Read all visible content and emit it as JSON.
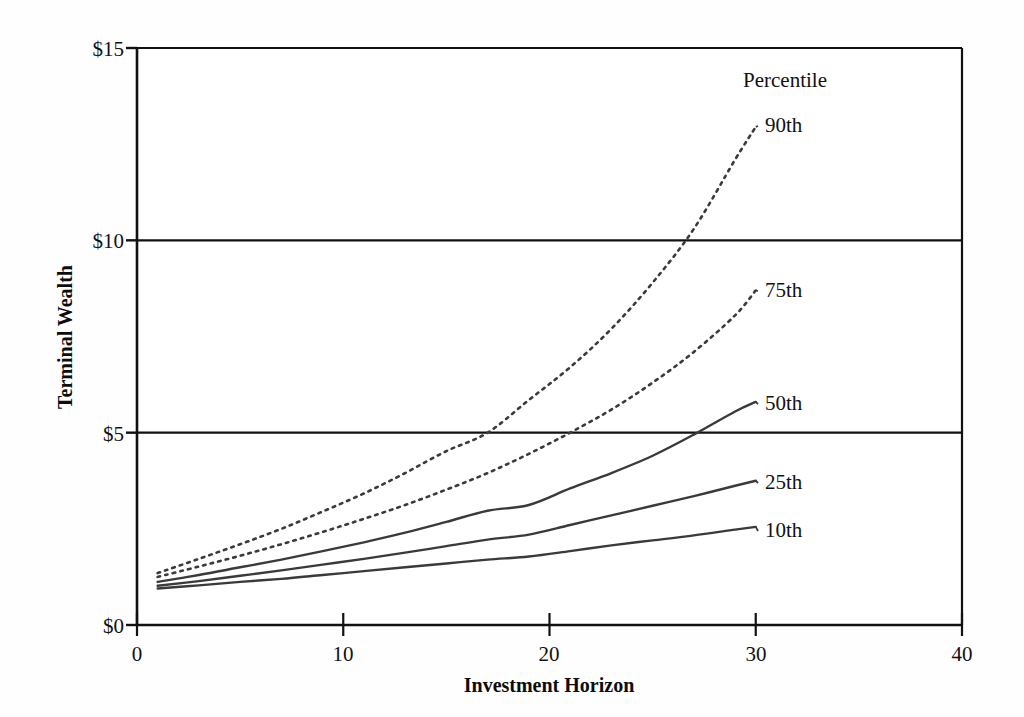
{
  "chart_data": {
    "type": "line",
    "title": "",
    "xlabel": "Investment Horizon",
    "ylabel": "Terminal Wealth",
    "xlim": [
      0,
      40
    ],
    "ylim": [
      0,
      15
    ],
    "xticks": [
      0,
      10,
      20,
      30,
      40
    ],
    "xtick_labels": [
      "0",
      "10",
      "20",
      "30",
      "40"
    ],
    "yticks": [
      0,
      5,
      10,
      15
    ],
    "ytick_labels": [
      "$0",
      "$5",
      "$10",
      "$15"
    ],
    "grid": "horizontal gridlines at $5 and $10 only",
    "legend_position": "inline labels at right end of each curve",
    "legend_title": "Percentile",
    "x": [
      1,
      3,
      5,
      7,
      9,
      11,
      13,
      15,
      17,
      19,
      21,
      23,
      25,
      27,
      29,
      30
    ],
    "series": [
      {
        "name": "90th",
        "label": "90th",
        "style": "dotted",
        "values": [
          1.35,
          1.72,
          2.1,
          2.5,
          2.95,
          3.42,
          3.95,
          4.52,
          5.0,
          5.85,
          6.7,
          7.7,
          8.9,
          10.3,
          12.1,
          12.95
        ],
        "end_value": 12.95
      },
      {
        "name": "75th",
        "label": "75th",
        "style": "dotted",
        "values": [
          1.25,
          1.52,
          1.8,
          2.1,
          2.42,
          2.76,
          3.12,
          3.52,
          3.95,
          4.45,
          5.0,
          5.6,
          6.3,
          7.1,
          8.05,
          8.7
        ],
        "end_value": 8.7
      },
      {
        "name": "50th",
        "label": "50th",
        "style": "solid",
        "values": [
          1.12,
          1.3,
          1.5,
          1.7,
          1.92,
          2.15,
          2.4,
          2.68,
          2.97,
          3.12,
          3.55,
          3.95,
          4.4,
          4.95,
          5.55,
          5.8
        ],
        "end_value": 5.8
      },
      {
        "name": "25th",
        "label": "25th",
        "style": "solid",
        "values": [
          1.02,
          1.14,
          1.28,
          1.42,
          1.57,
          1.72,
          1.88,
          2.05,
          2.22,
          2.35,
          2.6,
          2.85,
          3.1,
          3.35,
          3.62,
          3.75
        ],
        "end_value": 3.75
      },
      {
        "name": "10th",
        "label": "10th",
        "style": "solid",
        "values": [
          0.95,
          1.03,
          1.12,
          1.2,
          1.3,
          1.4,
          1.5,
          1.6,
          1.7,
          1.78,
          1.92,
          2.07,
          2.2,
          2.33,
          2.48,
          2.55
        ],
        "end_value": 2.55
      }
    ],
    "annotations": [
      "90th percentile crosses $5 near horizon 17 and $10 near horizon 26",
      "75th percentile crosses $5 near horizon 21",
      "50th percentile crosses $5 near horizon 27"
    ],
    "colors": {
      "axis": "#111111",
      "gridline": "#111111",
      "series_line": "#3a3a3a",
      "background": "#fefefe"
    }
  },
  "legend": {
    "title": "Percentile",
    "entries": [
      "90th",
      "75th",
      "50th",
      "25th",
      "10th"
    ]
  },
  "axes": {
    "y_title": "Terminal Wealth",
    "x_title": "Investment Horizon",
    "y_tick_labels": [
      "$15",
      "$10",
      "$5",
      "$0"
    ],
    "x_tick_labels": [
      "0",
      "10",
      "20",
      "30",
      "40"
    ]
  }
}
